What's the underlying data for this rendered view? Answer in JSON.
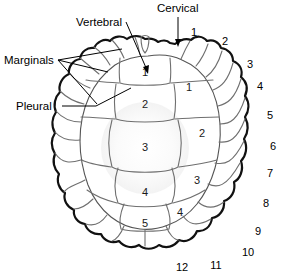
{
  "figure": {
    "background_color": "#ffffff",
    "shell_fill": "#d3d3d3",
    "shell_center_fill": "#fbfbfb",
    "outline_color": "#111111",
    "seam_color": "#6f6f6f"
  },
  "labels": {
    "cervical": "Cervical",
    "vertebral": "Vertebral",
    "marginals": "Marginals",
    "pleural": "Pleural"
  },
  "vertebral_scutes": {
    "name": "Vertebral",
    "numbers": [
      "1",
      "2",
      "3",
      "4",
      "5"
    ]
  },
  "pleural_scutes": {
    "name": "Pleural",
    "numbers": [
      "1",
      "2",
      "3",
      "4"
    ]
  },
  "marginal_scutes": {
    "name": "Marginals",
    "numbers": [
      "1",
      "2",
      "3",
      "4",
      "5",
      "6",
      "7",
      "8",
      "9",
      "10",
      "11",
      "12"
    ]
  }
}
